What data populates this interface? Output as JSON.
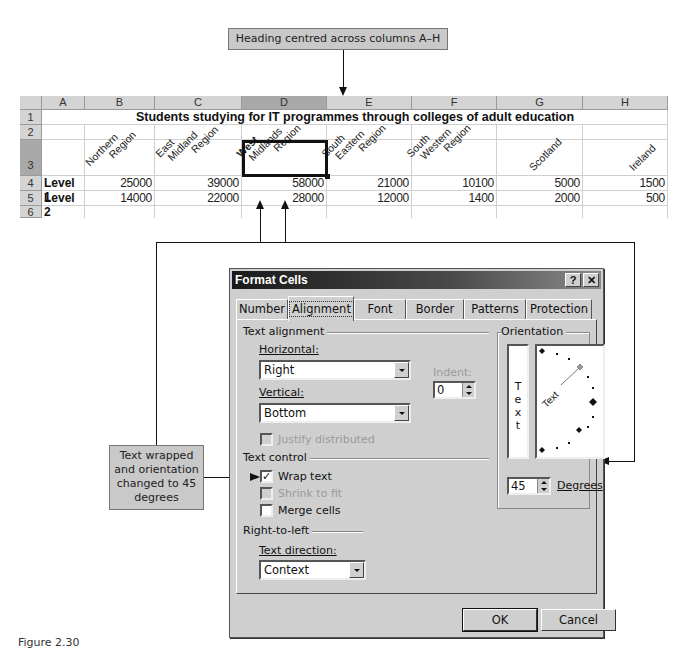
{
  "callouts": {
    "heading": "Heading centred across columns A–H",
    "wrap": [
      "Text wrapped",
      "and orientation",
      "changed to 45",
      "degrees"
    ]
  },
  "sheet": {
    "columns": [
      "A",
      "B",
      "C",
      "D",
      "E",
      "F",
      "G",
      "H"
    ],
    "rows": [
      "1",
      "2",
      "3",
      "4",
      "5",
      "6"
    ],
    "selected_column": "D",
    "selected_row": "3",
    "title": "Students studying for IT programmes through colleges of adult education",
    "headers": [
      {
        "line1": "Northern",
        "line2": "Region"
      },
      {
        "line1": "East",
        "line2": "Midland",
        "line3": "Region"
      },
      {
        "line1": "West",
        "line2": "Midlands",
        "line3": "Region"
      },
      {
        "line1": "South",
        "line2": "Eastern",
        "line3": "Region"
      },
      {
        "line1": "South",
        "line2": "Western",
        "line3": "Region"
      },
      {
        "line1": "Scotland"
      },
      {
        "line1": "Ireland"
      }
    ],
    "data": [
      {
        "label": "Level 1",
        "values": [
          "25000",
          "39000",
          "58000",
          "21000",
          "10100",
          "5000",
          "1500"
        ]
      },
      {
        "label": "Level 2",
        "values": [
          "14000",
          "22000",
          "28000",
          "12000",
          "1400",
          "2000",
          "500"
        ]
      }
    ]
  },
  "dialog": {
    "title": "Format Cells",
    "help": "?",
    "close": "✕",
    "tabs": [
      "Number",
      "Alignment",
      "Font",
      "Border",
      "Patterns",
      "Protection"
    ],
    "active_tab": "Alignment",
    "text_alignment": {
      "group": "Text alignment",
      "horizontal_label": "Horizontal:",
      "horizontal_value": "Right",
      "vertical_label": "Vertical:",
      "vertical_value": "Bottom",
      "indent_label": "Indent:",
      "indent_value": "0",
      "justify_distributed": "Justify distributed"
    },
    "text_control": {
      "group": "Text control",
      "wrap_text": "Wrap text",
      "wrap_checked": true,
      "shrink_to_fit": "Shrink to fit",
      "merge_cells": "Merge cells"
    },
    "rtl": {
      "group": "Right-to-left",
      "direction_label": "Text direction:",
      "direction_value": "Context"
    },
    "orientation": {
      "group": "Orientation",
      "vertical_text": [
        "T",
        "e",
        "x",
        "t"
      ],
      "dial_text": "Text",
      "degrees_value": "45",
      "degrees_label": "Degrees"
    },
    "ok": "OK",
    "cancel": "Cancel"
  },
  "figure_caption": "Figure 2.30"
}
